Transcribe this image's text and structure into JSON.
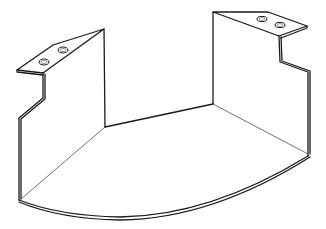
{
  "figure": {
    "type": "technical-line-drawing",
    "subject": "U-shaped sheet metal bracket with curved floor and two mounting tabs",
    "colors": {
      "line": "#1a1a1a",
      "background": "#ffffff"
    },
    "parts": [
      {
        "name": "left-mounting-tab",
        "holes": 2
      },
      {
        "name": "right-mounting-tab",
        "holes": 2
      },
      {
        "name": "left-side-wall"
      },
      {
        "name": "back-wall"
      },
      {
        "name": "right-side-wall"
      },
      {
        "name": "curved-floor-panel"
      }
    ]
  }
}
